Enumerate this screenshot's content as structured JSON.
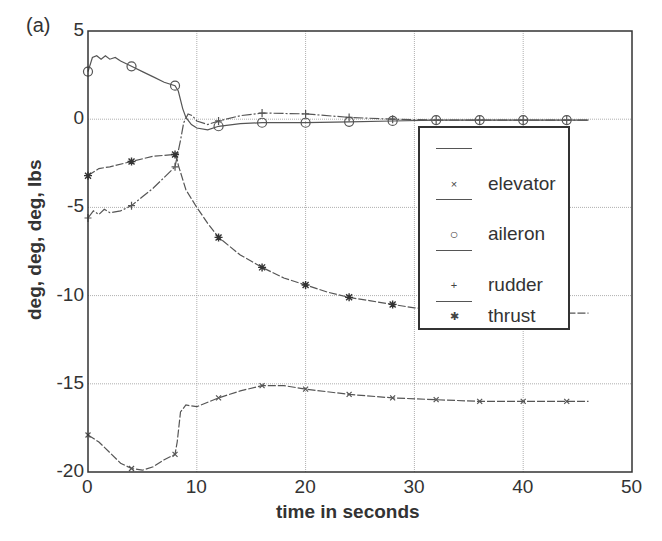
{
  "panel_label": "(a)",
  "chart_data": {
    "type": "line",
    "title": "",
    "xlabel": "time in seconds",
    "ylabel": "deg, deg, deg, lbs",
    "xlim": [
      0,
      50
    ],
    "ylim": [
      -20,
      5
    ],
    "xticks": [
      0,
      10,
      20,
      30,
      40,
      50
    ],
    "yticks": [
      5,
      0,
      -5,
      -10,
      -15,
      -20
    ],
    "xtick_labels": [
      "0",
      "10",
      "20",
      "30",
      "40",
      "50"
    ],
    "ytick_labels": [
      "5",
      "0",
      "-5",
      "-10",
      "-15",
      "-20"
    ],
    "grid": true,
    "legend_position": "inside right",
    "series": [
      {
        "name": "elevator",
        "marker": "x",
        "x": [
          0,
          1,
          2,
          3,
          4,
          5,
          6,
          7,
          8,
          8.2,
          8.5,
          9,
          10,
          12,
          14,
          16,
          18,
          20,
          24,
          28,
          32,
          36,
          40,
          44,
          46
        ],
        "y": [
          -17.9,
          -18.3,
          -18.9,
          -19.5,
          -19.8,
          -19.9,
          -19.7,
          -19.3,
          -19.0,
          -18.3,
          -16.6,
          -16.2,
          -16.3,
          -15.8,
          -15.4,
          -15.1,
          -15.1,
          -15.3,
          -15.6,
          -15.8,
          -15.9,
          -16.0,
          -16.0,
          -16.0,
          -16.0
        ],
        "marker_x": [
          0,
          4,
          8,
          12,
          16,
          20,
          24,
          28,
          32,
          36,
          40,
          44
        ]
      },
      {
        "name": "aileron",
        "marker": "o",
        "x": [
          0,
          0.4,
          0.8,
          1.2,
          1.6,
          2,
          2.5,
          3,
          4,
          5,
          6,
          7,
          8,
          8.3,
          8.7,
          9,
          9.5,
          10,
          11,
          12,
          14,
          16,
          20,
          24,
          28,
          32,
          36,
          40,
          44,
          46
        ],
        "y": [
          2.7,
          3.5,
          3.6,
          3.4,
          3.6,
          3.4,
          3.5,
          3.3,
          3.0,
          2.7,
          2.4,
          2.1,
          1.9,
          1.6,
          0.6,
          0.1,
          -0.3,
          -0.5,
          -0.6,
          -0.4,
          -0.25,
          -0.2,
          -0.2,
          -0.15,
          -0.1,
          -0.05,
          -0.05,
          -0.05,
          -0.05,
          -0.05
        ],
        "marker_x": [
          0,
          4,
          8,
          12,
          16,
          20,
          24,
          28,
          32,
          36,
          40,
          44
        ]
      },
      {
        "name": "rudder",
        "marker": "+",
        "x": [
          0,
          0.5,
          1,
          1.5,
          2,
          3,
          4,
          5,
          6,
          7,
          8,
          8.5,
          8.8,
          9.2,
          9.6,
          10,
          11,
          12,
          14,
          16,
          20,
          24,
          28,
          32,
          36,
          40,
          44,
          46
        ],
        "y": [
          -5.6,
          -5.2,
          -5.4,
          -5.1,
          -5.3,
          -5.2,
          -4.9,
          -4.4,
          -3.9,
          -3.3,
          -2.7,
          -1.2,
          -0.2,
          0.3,
          0.2,
          -0.1,
          -0.3,
          -0.1,
          0.2,
          0.35,
          0.3,
          0.1,
          0.0,
          -0.05,
          -0.05,
          -0.05,
          -0.05,
          -0.05
        ],
        "marker_x": [
          0,
          4,
          8,
          12,
          16,
          20,
          24,
          28,
          32,
          36,
          40,
          44
        ]
      },
      {
        "name": "thrust",
        "marker": "*",
        "x": [
          0,
          1,
          2,
          4,
          6,
          8,
          8.2,
          8.3,
          9,
          10,
          11,
          12,
          14,
          16,
          18,
          20,
          22,
          24,
          26,
          28,
          30,
          40,
          46
        ],
        "y": [
          -3.2,
          -2.8,
          -2.7,
          -2.4,
          -2.1,
          -2.0,
          -2.3,
          -2.6,
          -4.0,
          -5.0,
          -5.9,
          -6.7,
          -7.7,
          -8.4,
          -9.0,
          -9.4,
          -9.8,
          -10.1,
          -10.3,
          -10.5,
          -10.7,
          -11.0,
          -11.0
        ],
        "marker_x": [
          0,
          4,
          8,
          12,
          16,
          20,
          24,
          28
        ]
      }
    ]
  },
  "legend": {
    "items": [
      {
        "label": "elevator",
        "marker": "×"
      },
      {
        "label": "aileron",
        "marker": "○"
      },
      {
        "label": "rudder",
        "marker": "+"
      },
      {
        "label": "thrust",
        "marker": "✱"
      }
    ]
  },
  "colors": {
    "axis": "#333333",
    "grid": "#9a9a9a",
    "line": "#555555",
    "text": "#333333"
  }
}
